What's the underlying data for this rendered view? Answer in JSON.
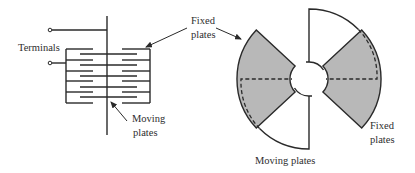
{
  "diagram": {
    "colors": {
      "line": "#2a2a2a",
      "fixed_plate_fill": "#b8b8b8",
      "background": "#ffffff"
    },
    "side_view": {
      "labels": {
        "terminals": "Terminals",
        "fixed_plates_line1": "Fixed",
        "fixed_plates_line2": "plates",
        "moving_plates_line1": "Moving",
        "moving_plates_line2": "plates"
      },
      "fixed_plate_count": 6,
      "moving_plate_count": 5
    },
    "top_view": {
      "labels": {
        "moving_plates": "Moving plates",
        "fixed_plates_line1": "Fixed",
        "fixed_plates_line2": "plates"
      }
    }
  }
}
